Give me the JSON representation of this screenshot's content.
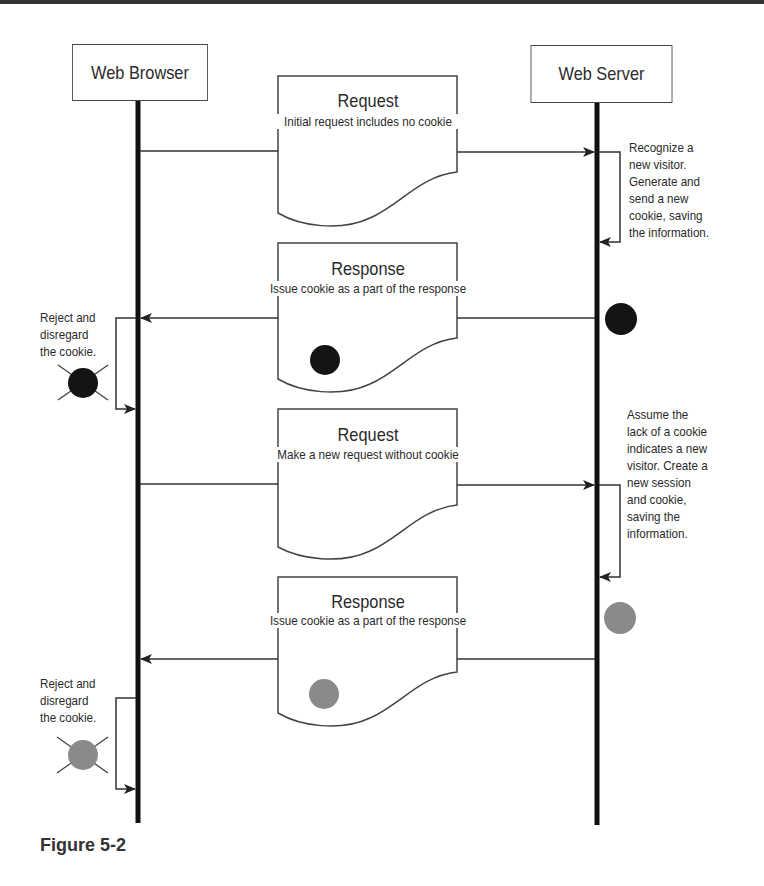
{
  "actors": {
    "browser": "Web Browser",
    "server": "Web Server"
  },
  "messages": [
    {
      "title": "Request",
      "subtitle": "Initial request includes no cookie",
      "direction": "browser-to-server",
      "cookie": "none"
    },
    {
      "title": "Response",
      "subtitle": "Issue cookie as a part of the response",
      "direction": "server-to-browser",
      "cookie": "black"
    },
    {
      "title": "Request",
      "subtitle": "Make a new request without cookie",
      "direction": "browser-to-server",
      "cookie": "none"
    },
    {
      "title": "Response",
      "subtitle": "Issue cookie as a part of the response",
      "direction": "server-to-browser",
      "cookie": "gray"
    }
  ],
  "server_notes": [
    "Recognize a\nnew visitor.\nGenerate and\nsend a new\ncookie, saving\nthe information.",
    "Assume the\nlack of a cookie\nindicates a new\nvisitor. Create a\nnew session\nand cookie,\nsaving the\ninformation."
  ],
  "browser_notes": [
    "Reject and\ndisregard\nthe cookie.",
    "Reject and\ndisregard\nthe cookie."
  ],
  "colors": {
    "cookie_black": "#141414",
    "cookie_gray": "#8a8a8a",
    "line": "#333333"
  },
  "caption": "Figure 5-2"
}
